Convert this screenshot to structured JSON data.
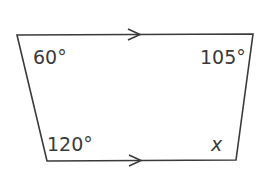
{
  "diagram": {
    "shape": "trapezium",
    "colors": {
      "stroke": "#3a3a3a",
      "background": "#ffffff"
    },
    "vertices": {
      "top_left": [
        17,
        35
      ],
      "top_right": [
        253,
        34
      ],
      "bottom_right": [
        236,
        160
      ],
      "bottom_left": [
        47,
        161
      ]
    },
    "parallel_marks": [
      "top-edge-arrow",
      "bottom-edge-arrow"
    ],
    "angles": {
      "top_left": "60°",
      "top_right": "105°",
      "bottom_left": "120°",
      "bottom_right": "x"
    }
  }
}
